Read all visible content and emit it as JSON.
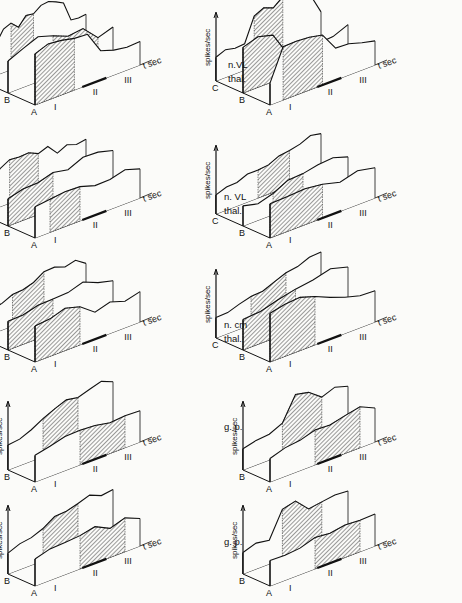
{
  "figure": {
    "ylabel": "spikes/sec",
    "xlabel": "t sec",
    "period_labels": [
      "I",
      "II",
      "III"
    ],
    "hatch_color": "#222222",
    "line_color": "#111111",
    "background": "#fbfbf9"
  },
  "row_labels": [
    {
      "line1": "n.VL",
      "line2": "thal."
    },
    {
      "line1": "n. VL",
      "line2": "thal."
    },
    {
      "line1": "n. cm",
      "line2": "thal."
    },
    {
      "line1": "g. p.",
      "line2": ""
    },
    {
      "line1": "g. p.",
      "line2": ""
    }
  ],
  "chart_data": [
    {
      "type": "area",
      "title": "n.VL thal. (left)",
      "panel": "row1-left",
      "x": 5,
      "y": 15,
      "traces": [
        {
          "name": "C",
          "base": 0.45,
          "shape": [
            0.45,
            0.5,
            0.55,
            0.8,
            0.85,
            0.7,
            0.9,
            0.85,
            0.95,
            1.0,
            0.9,
            0.85,
            0.5,
            0.45,
            0.5
          ],
          "shade": [
            4,
            7
          ]
        },
        {
          "name": "B",
          "base": 0.45,
          "shape": [
            0.6,
            0.7,
            0.8,
            0.75,
            0.6,
            0.65,
            0.4,
            0.45
          ],
          "shade": [
            3,
            6
          ]
        },
        {
          "name": "A",
          "base": 0.45,
          "shape": [
            0.95,
            1.0,
            1.0,
            0.95,
            0.9,
            0.55,
            0.45,
            0.4,
            0.45
          ],
          "shade": [
            0,
            3
          ]
        }
      ]
    },
    {
      "type": "area",
      "title": "n.VL thal. (right)",
      "panel": "row1-right",
      "x": 240,
      "y": 15,
      "traces": [
        {
          "name": "C",
          "base": 0.45,
          "shape": [
            0.45,
            0.5,
            0.45,
            0.5,
            0.9,
            1.0,
            0.95,
            1.05,
            1.1,
            1.15,
            0.85,
            0.55
          ],
          "shade": [
            4,
            7
          ]
        },
        {
          "name": "B",
          "base": 0.45,
          "shape": [
            0.85,
            0.9,
            0.85,
            0.4,
            0.35,
            0.4,
            0.4,
            0.5
          ],
          "shade": [
            0,
            4
          ]
        },
        {
          "name": "A",
          "base": 0.45,
          "shape": [
            0.4,
            0.95,
            1.0,
            0.95,
            0.9,
            0.6,
            0.55,
            0.5,
            0.45
          ],
          "shade": [
            1,
            4
          ]
        }
      ]
    },
    {
      "type": "area",
      "title": "n. VL thal. (left)",
      "panel": "row2-left",
      "x": 5,
      "y": 148,
      "traces": [
        {
          "name": "C",
          "base": 0.45,
          "shape": [
            0.4,
            0.45,
            0.7,
            0.8,
            0.75,
            0.8,
            0.7,
            0.75,
            0.6,
            0.65,
            0.6,
            0.65
          ],
          "shade": [
            3,
            6
          ]
        },
        {
          "name": "B",
          "base": 0.45,
          "shape": [
            0.5,
            0.55,
            0.6,
            0.65,
            0.6,
            0.75,
            0.7,
            0.65
          ],
          "shade": [
            0,
            3
          ]
        },
        {
          "name": "A",
          "base": 0.45,
          "shape": [
            0.55,
            0.6,
            0.65,
            0.6,
            0.55,
            0.55,
            0.6,
            0.55
          ],
          "shade": [
            1,
            3
          ]
        }
      ]
    },
    {
      "type": "area",
      "title": "n. VL thal. (right)",
      "panel": "row2-right",
      "x": 240,
      "y": 148,
      "traces": [
        {
          "name": "C",
          "base": 0.45,
          "shape": [
            0.35,
            0.4,
            0.45,
            0.5,
            0.5,
            0.55,
            0.6,
            0.65,
            0.7,
            0.75,
            0.75
          ],
          "shade": [
            4,
            7
          ]
        },
        {
          "name": "B",
          "base": 0.45,
          "shape": [
            0.35,
            0.3,
            0.4,
            0.5,
            0.55,
            0.6,
            0.6,
            0.55
          ],
          "shade": [
            2,
            4
          ]
        },
        {
          "name": "A",
          "base": 0.45,
          "shape": [
            0.6,
            0.65,
            0.65,
            0.6,
            0.55,
            0.6,
            0.55
          ],
          "shade": [
            0,
            3
          ]
        }
      ]
    },
    {
      "type": "area",
      "title": "n. cm thal. (left)",
      "panel": "row3-left",
      "x": 5,
      "y": 272,
      "traces": [
        {
          "name": "C",
          "base": 0.45,
          "shape": [
            0.4,
            0.45,
            0.5,
            0.55,
            0.6,
            0.65,
            0.75,
            0.8,
            0.7,
            0.75,
            0.65
          ],
          "shade": [
            3,
            6
          ]
        },
        {
          "name": "B",
          "base": 0.45,
          "shape": [
            0.5,
            0.55,
            0.6,
            0.6,
            0.65,
            0.7,
            0.6,
            0.55
          ],
          "shade": [
            0,
            3
          ]
        },
        {
          "name": "A",
          "base": 0.45,
          "shape": [
            0.65,
            0.7,
            0.75,
            0.7,
            0.5,
            0.55,
            0.5,
            0.55
          ],
          "shade": [
            0,
            3
          ]
        }
      ]
    },
    {
      "type": "area",
      "title": "n. cm thal. (right)",
      "panel": "row3-right",
      "x": 240,
      "y": 272,
      "traces": [
        {
          "name": "C",
          "base": 0.45,
          "shape": [
            0.35,
            0.4,
            0.45,
            0.5,
            0.55,
            0.6,
            0.7,
            0.75,
            0.8,
            0.85
          ],
          "shade": [
            3,
            6
          ]
        },
        {
          "name": "B",
          "base": 0.45,
          "shape": [
            0.55,
            0.6,
            0.65,
            0.75,
            0.8,
            0.85,
            0.8
          ],
          "shade": [
            0,
            3
          ]
        },
        {
          "name": "A",
          "base": 0.45,
          "shape": [
            0.9,
            0.95,
            0.95,
            0.9,
            0.75,
            0.65,
            0.6,
            0.55
          ],
          "shade": [
            0,
            3
          ]
        }
      ]
    },
    {
      "type": "area",
      "title": "g. p. (left, 4th row)",
      "panel": "row4-left",
      "x": 5,
      "y": 392,
      "traces": [
        {
          "name": "B",
          "base": 0.45,
          "shape": [
            0.45,
            0.5,
            0.55,
            0.7,
            0.8,
            0.85,
            0.85,
            0.9,
            0.95,
            0.9
          ],
          "shade": [
            3,
            6
          ]
        },
        {
          "name": "A",
          "base": 0.45,
          "shape": [
            0.5,
            0.55,
            0.6,
            0.65,
            0.6,
            0.55,
            0.6,
            0.55
          ],
          "shade": [
            3,
            6
          ]
        }
      ]
    },
    {
      "type": "area",
      "title": "g. p. (right, 4th row)",
      "panel": "row4-right",
      "x": 240,
      "y": 392,
      "traces": [
        {
          "name": "B",
          "base": 0.45,
          "shape": [
            0.4,
            0.45,
            0.45,
            0.6,
            1.0,
            0.95,
            0.8,
            0.85,
            0.8
          ],
          "shade": [
            3,
            6
          ]
        },
        {
          "name": "A",
          "base": 0.45,
          "shape": [
            0.45,
            0.5,
            0.55,
            0.65,
            0.6,
            0.7,
            0.75,
            0.6
          ],
          "shade": [
            3,
            6
          ]
        }
      ]
    },
    {
      "type": "area",
      "title": "g. p. (left, 5th row)",
      "panel": "row5-left",
      "x": 5,
      "y": 496,
      "traces": [
        {
          "name": "B",
          "base": 0.45,
          "shape": [
            0.4,
            0.45,
            0.5,
            0.6,
            0.7,
            0.75,
            0.8,
            0.85,
            0.8,
            0.8
          ],
          "shade": [
            3,
            6
          ]
        },
        {
          "name": "A",
          "base": 0.45,
          "shape": [
            0.5,
            0.55,
            0.6,
            0.6,
            0.65,
            0.55,
            0.6,
            0.5
          ],
          "shade": [
            3,
            6
          ]
        }
      ]
    },
    {
      "type": "area",
      "title": "g. p. (right, 5th row)",
      "panel": "row5-right",
      "x": 240,
      "y": 496,
      "traces": [
        {
          "name": "B",
          "base": 0.45,
          "shape": [
            0.4,
            0.45,
            0.45,
            0.9,
            0.95,
            0.75,
            0.75,
            0.8,
            0.8
          ],
          "shade": [
            3,
            6
          ]
        },
        {
          "name": "A",
          "base": 0.45,
          "shape": [
            0.45,
            0.45,
            0.5,
            0.55,
            0.55,
            0.6,
            0.55,
            0.6
          ],
          "shade": [
            3,
            6
          ]
        }
      ]
    }
  ]
}
